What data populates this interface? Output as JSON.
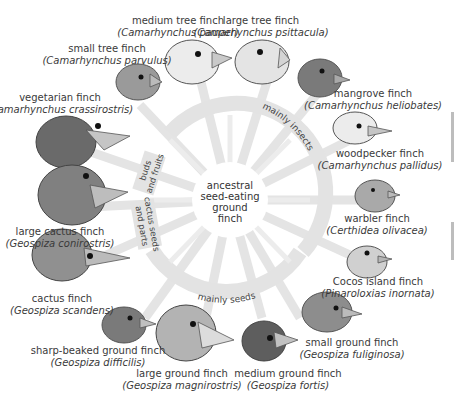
{
  "center": {
    "label_lines": [
      "ancestral",
      "seed-eating",
      "ground",
      "finch"
    ]
  },
  "diet_groups": [
    {
      "label": "mainly insects"
    },
    {
      "label": "mainly seeds"
    },
    {
      "label_lines": [
        "buds",
        "and fruits"
      ]
    },
    {
      "label_lines": [
        "cactus seeds",
        "and parts"
      ]
    }
  ],
  "finches": [
    {
      "common": "medium tree finch",
      "scientific": "Camarhynchus pauper"
    },
    {
      "common": "large tree finch",
      "scientific": "Camarhynchus psittacula"
    },
    {
      "common": "small tree finch",
      "scientific": "Camarhynchus parvulus"
    },
    {
      "common": "mangrove finch",
      "scientific": "Camarhynchus heliobates"
    },
    {
      "common": "vegetarian finch",
      "scientific": "Camarhynchus crassirostris"
    },
    {
      "common": "woodpecker finch",
      "scientific": "Camarhynchus pallidus"
    },
    {
      "common": "warbler finch",
      "scientific": "Certhidea olivacea"
    },
    {
      "common": "large cactus finch",
      "scientific": "Geospiza conirostris"
    },
    {
      "common": "Cocos island finch",
      "scientific": "Pinaroloxias inornata"
    },
    {
      "common": "cactus finch",
      "scientific": "Geospiza scandens"
    },
    {
      "common": "small ground finch",
      "scientific": "Geospiza fuliginosa"
    },
    {
      "common": "sharp-beaked ground finch",
      "scientific": "Geospiza difficilis"
    },
    {
      "common": "large ground finch",
      "scientific": "Geospiza magnirostris"
    },
    {
      "common": "medium ground finch",
      "scientific": "Geospiza fortis"
    }
  ],
  "colors": {
    "wheel": "#e3e3e3",
    "text": "#3a3a3a",
    "dark_bird": "#6f6f6f",
    "mid_bird": "#8c8c8c",
    "light_bird": "#d9d9d9",
    "beak": "#b8b8b8"
  }
}
